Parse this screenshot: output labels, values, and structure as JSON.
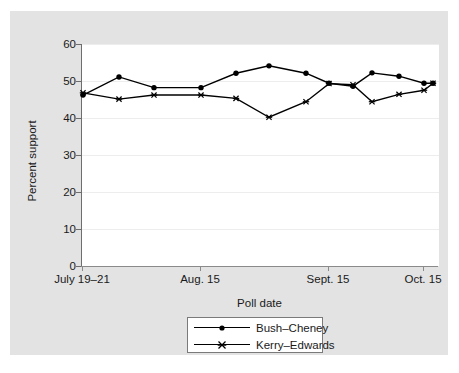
{
  "chart_data": {
    "type": "line",
    "title": "",
    "xlabel": "Poll date",
    "ylabel": "Percent support",
    "ylim": [
      0,
      60
    ],
    "yticks": [
      0,
      10,
      20,
      30,
      40,
      50,
      60
    ],
    "grid": true,
    "legend_position": "bottom-center",
    "x_tick_labels": [
      "July 19–21",
      "Aug. 15",
      "Sept. 15",
      "Oct. 15"
    ],
    "x_tick_indices": [
      0,
      3,
      7,
      11
    ],
    "x_index_count": 15,
    "series": [
      {
        "name": "Bush–Cheney",
        "marker": "filled-circle",
        "color": "#000000",
        "values": [
          46.2,
          51.1,
          48.2,
          48.2,
          52.1,
          54.1,
          52.1,
          49.4,
          48.6,
          52.2,
          51.3,
          49.4,
          49.4
        ]
      },
      {
        "name": "Kerry–Edwards",
        "marker": "x-cross",
        "color": "#000000",
        "values": [
          46.8,
          45.1,
          46.2,
          46.2,
          45.3,
          40.2,
          44.4,
          49.3,
          49.0,
          44.4,
          46.4,
          47.5,
          49.4
        ]
      }
    ],
    "x_positions": [
      72,
      108,
      143,
      190,
      225,
      258,
      295,
      318,
      342,
      361,
      388,
      413,
      422
    ]
  },
  "axes": {
    "y_tick_labels": [
      "60",
      "50",
      "40",
      "30",
      "20",
      "10",
      "0"
    ],
    "y_axis_title": "Percent support",
    "x_axis_title": "Poll date"
  },
  "legend": {
    "entries": [
      {
        "label": "Bush–Cheney",
        "marker": "filled-circle"
      },
      {
        "label": "Kerry–Edwards",
        "marker": "x-cross"
      }
    ]
  },
  "colors": {
    "figure_background": "#e3e3e3",
    "plot_background": "#ffffff",
    "grid": "#ededed",
    "axis": "#6e6e6e",
    "series": "#000000",
    "text": "#1a1a1a"
  }
}
